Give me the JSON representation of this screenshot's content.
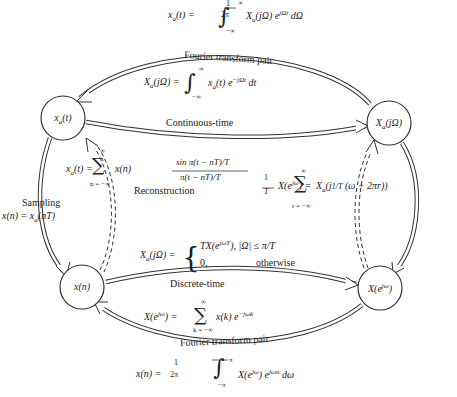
{
  "nodes": {
    "xa_t": {
      "label": "x_a(t)",
      "cx": 63,
      "cy": 118
    },
    "Xa_jw": {
      "label": "X_a(jΩ)",
      "cx": 389,
      "cy": 123
    },
    "x_n": {
      "label": "x(n)",
      "cx": 82,
      "cy": 287
    },
    "X_ejw": {
      "label": "X(e^jω)",
      "cx": 380,
      "cy": 288
    }
  },
  "edges": {
    "top_pair_label": "Fourier transform pair",
    "continuous_time_label": "Continuous-time",
    "discrete_time_label": "Discrete-time",
    "bottom_pair_label": "Fourier transform pair",
    "sampling_label": "Sampling",
    "sampling_eq": "x(n) = x_a(nT)",
    "reconstruction_label": "Reconstruction"
  },
  "equations": {
    "inverse_ctft": "x_a(t) = 1/2π ∫_{-∞}^{∞} X_a(jΩ) e^{jΩt} dΩ",
    "ctft": "X_a(jΩ) = ∫_{-∞}^{∞} x_a(t) e^{-jΩt} dt",
    "reconstruction": "x_a(t) = Σ_{n=-∞}^{∞} x(n) sin π(t − nT)/T / π(t − nT)/T",
    "aliasing": "X(e^{jω}) = 1/T Σ_{r=-∞}^{∞} X_a(j 1/T (ω + 2πr))",
    "bandlimited": "X_a(jΩ) = { TX(e^{jΩT}), |Ω| ≤ π/T ; 0, otherwise }",
    "dtft": "X(e^{jω}) = Σ_{k=-∞}^{∞} x(k) e^{-jωk}",
    "inverse_dtft": "x(n) = 1/2π ∫_{-π}^{π} X(e^{jω}) e^{jωn} dω"
  },
  "text": {
    "frac_1": "1",
    "frac_2pi": "2π",
    "frac_T": "T",
    "inf": "∞",
    "neg_inf_n": "n = −∞",
    "neg_inf_k": "k = −∞",
    "neg_inf_r": "r = −∞",
    "pi": "π",
    "neg_pi": "−π",
    "neg_inf": "−∞",
    "otherwise": "otherwise",
    "zero": "0,"
  }
}
